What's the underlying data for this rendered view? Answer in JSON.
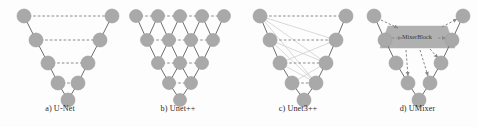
{
  "figure": {
    "background_color": "#fdfdfd",
    "node_color": "#a9a9a9",
    "node_stroke_color": "#9a9a9a",
    "solid_edge_color": "#6e6e6e",
    "dashed_edge_color": "#8a8a8a",
    "faint_edge_color": "#c8c8c8",
    "mixer_fill_color": "#b0b0b0",
    "caption_color": "#2a2a2a"
  },
  "panels": [
    {
      "id": "unet",
      "caption": "a) U-Net",
      "x": 0,
      "width": 120,
      "nodes": [
        {
          "name": "enc-1",
          "cx": 24,
          "cy": 16,
          "r": 7
        },
        {
          "name": "enc-2",
          "cx": 36,
          "cy": 40,
          "r": 7
        },
        {
          "name": "enc-3",
          "cx": 48,
          "cy": 63,
          "r": 7
        },
        {
          "name": "enc-4",
          "cx": 58,
          "cy": 83,
          "r": 7
        },
        {
          "name": "bottleneck",
          "cx": 68,
          "cy": 100,
          "r": 7
        },
        {
          "name": "dec-4",
          "cx": 78,
          "cy": 83,
          "r": 7
        },
        {
          "name": "dec-3",
          "cx": 88,
          "cy": 63,
          "r": 7
        },
        {
          "name": "dec-2",
          "cx": 100,
          "cy": 40,
          "r": 7
        },
        {
          "name": "dec-1",
          "cx": 112,
          "cy": 16,
          "r": 7
        }
      ],
      "solid_edges": [
        [
          0,
          1
        ],
        [
          1,
          2
        ],
        [
          2,
          3
        ],
        [
          3,
          4
        ],
        [
          4,
          5
        ],
        [
          5,
          6
        ],
        [
          6,
          7
        ],
        [
          7,
          8
        ]
      ],
      "dashed_edges": [
        [
          0,
          8
        ],
        [
          1,
          7
        ],
        [
          2,
          6
        ],
        [
          3,
          5
        ]
      ],
      "faint_edges": []
    },
    {
      "id": "unetpp",
      "caption": "b) Unet++",
      "x": 118,
      "width": 120,
      "nodes": [
        {
          "name": "x00",
          "cx": 18,
          "cy": 16,
          "r": 6.5
        },
        {
          "name": "x01",
          "cx": 40,
          "cy": 16,
          "r": 6.5
        },
        {
          "name": "x02",
          "cx": 62,
          "cy": 16,
          "r": 6.5
        },
        {
          "name": "x03",
          "cx": 84,
          "cy": 16,
          "r": 6.5
        },
        {
          "name": "x04",
          "cx": 106,
          "cy": 16,
          "r": 6.5
        },
        {
          "name": "x10",
          "cx": 29,
          "cy": 40,
          "r": 6.5
        },
        {
          "name": "x11",
          "cx": 51,
          "cy": 40,
          "r": 6.5
        },
        {
          "name": "x12",
          "cx": 73,
          "cy": 40,
          "r": 6.5
        },
        {
          "name": "x13",
          "cx": 95,
          "cy": 40,
          "r": 6.5
        },
        {
          "name": "x20",
          "cx": 40,
          "cy": 63,
          "r": 6.5
        },
        {
          "name": "x21",
          "cx": 62,
          "cy": 63,
          "r": 6.5
        },
        {
          "name": "x22",
          "cx": 84,
          "cy": 63,
          "r": 6.5
        },
        {
          "name": "x30",
          "cx": 51,
          "cy": 83,
          "r": 6.5
        },
        {
          "name": "x31",
          "cx": 73,
          "cy": 83,
          "r": 6.5
        },
        {
          "name": "x40",
          "cx": 62,
          "cy": 100,
          "r": 6.5
        }
      ],
      "solid_edges": [
        [
          0,
          5
        ],
        [
          5,
          1
        ],
        [
          1,
          6
        ],
        [
          6,
          2
        ],
        [
          2,
          7
        ],
        [
          7,
          3
        ],
        [
          3,
          8
        ],
        [
          8,
          4
        ],
        [
          5,
          9
        ],
        [
          9,
          6
        ],
        [
          6,
          10
        ],
        [
          10,
          7
        ],
        [
          7,
          11
        ],
        [
          11,
          8
        ],
        [
          9,
          12
        ],
        [
          12,
          10
        ],
        [
          10,
          13
        ],
        [
          13,
          11
        ],
        [
          12,
          14
        ],
        [
          14,
          13
        ]
      ],
      "dashed_edges": [
        [
          0,
          1
        ],
        [
          1,
          2
        ],
        [
          2,
          3
        ],
        [
          3,
          4
        ],
        [
          5,
          6
        ],
        [
          6,
          7
        ],
        [
          7,
          8
        ],
        [
          9,
          10
        ],
        [
          10,
          11
        ],
        [
          12,
          13
        ]
      ],
      "faint_edges": []
    },
    {
      "id": "unet3pp",
      "caption": "c) Unet3++",
      "x": 238,
      "width": 120,
      "nodes": [
        {
          "name": "enc-1",
          "cx": 22,
          "cy": 16,
          "r": 7
        },
        {
          "name": "enc-2",
          "cx": 32,
          "cy": 40,
          "r": 7
        },
        {
          "name": "enc-3",
          "cx": 42,
          "cy": 63,
          "r": 7
        },
        {
          "name": "enc-4",
          "cx": 54,
          "cy": 83,
          "r": 7
        },
        {
          "name": "bottleneck",
          "cx": 66,
          "cy": 100,
          "r": 7
        },
        {
          "name": "dec-4",
          "cx": 78,
          "cy": 83,
          "r": 7
        },
        {
          "name": "dec-3",
          "cx": 88,
          "cy": 63,
          "r": 7
        },
        {
          "name": "dec-2",
          "cx": 98,
          "cy": 40,
          "r": 7
        },
        {
          "name": "dec-1",
          "cx": 108,
          "cy": 16,
          "r": 7
        }
      ],
      "solid_edges": [
        [
          0,
          1
        ],
        [
          1,
          2
        ],
        [
          2,
          3
        ],
        [
          3,
          4
        ],
        [
          4,
          5
        ],
        [
          5,
          6
        ],
        [
          6,
          7
        ],
        [
          7,
          8
        ]
      ],
      "dashed_edges": [
        [
          0,
          8
        ],
        [
          1,
          7
        ],
        [
          2,
          6
        ],
        [
          3,
          5
        ]
      ],
      "faint_edges": [
        [
          0,
          7
        ],
        [
          0,
          6
        ],
        [
          0,
          5
        ],
        [
          1,
          6
        ],
        [
          1,
          5
        ],
        [
          2,
          5
        ],
        [
          2,
          7
        ],
        [
          3,
          6
        ]
      ]
    },
    {
      "id": "umixer",
      "caption": "d) UMixer",
      "x": 358,
      "width": 119,
      "mixer_block": {
        "label": "MixerBlock",
        "points": "30,26 89,26 97,48 22,48",
        "text_x": 59,
        "text_y": 39
      },
      "nodes": [
        {
          "name": "enc-1",
          "cx": 16,
          "cy": 16,
          "r": 7
        },
        {
          "name": "enc-2",
          "cx": 27,
          "cy": 40,
          "r": 7
        },
        {
          "name": "enc-3",
          "cx": 38,
          "cy": 63,
          "r": 7
        },
        {
          "name": "enc-4",
          "cx": 50,
          "cy": 83,
          "r": 7
        },
        {
          "name": "bottleneck",
          "cx": 61,
          "cy": 100,
          "r": 7
        },
        {
          "name": "dec-4",
          "cx": 72,
          "cy": 83,
          "r": 7
        },
        {
          "name": "dec-3",
          "cx": 83,
          "cy": 63,
          "r": 7
        },
        {
          "name": "dec-2",
          "cx": 94,
          "cy": 40,
          "r": 7
        },
        {
          "name": "dec-1",
          "cx": 105,
          "cy": 16,
          "r": 7
        }
      ],
      "solid_edges": [
        [
          0,
          1
        ],
        [
          1,
          2
        ],
        [
          2,
          3
        ],
        [
          3,
          4
        ],
        [
          4,
          5
        ],
        [
          5,
          6
        ],
        [
          6,
          7
        ],
        [
          7,
          8
        ]
      ],
      "dashed_edges": [],
      "faint_edges": [],
      "mixer_in_arrows": [
        {
          "name": "arrow-enc1-to-mixer",
          "x1": 23,
          "y1": 20,
          "x2": 40,
          "y2": 28
        },
        {
          "name": "arrow-enc2-to-mixer",
          "x1": 34,
          "y1": 38,
          "x2": 44,
          "y2": 38
        }
      ],
      "mixer_out_arrows": [
        {
          "name": "arrow-mixer-to-dec1",
          "x1": 84,
          "y1": 27,
          "x2": 99,
          "y2": 19
        },
        {
          "name": "arrow-mixer-to-dec2",
          "x1": 80,
          "y1": 38,
          "x2": 88,
          "y2": 38
        },
        {
          "name": "arrow-mixer-to-dec3",
          "x1": 72,
          "y1": 49,
          "x2": 80,
          "y2": 58
        },
        {
          "name": "arrow-mixer-to-dec4",
          "x1": 62,
          "y1": 50,
          "x2": 70,
          "y2": 76
        },
        {
          "name": "arrow-mixer-to-enc4",
          "x1": 48,
          "y1": 50,
          "x2": 50,
          "y2": 76
        }
      ]
    }
  ]
}
